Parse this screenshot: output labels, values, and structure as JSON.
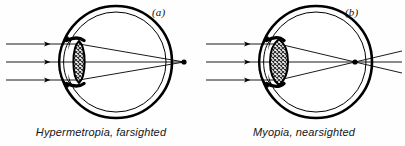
{
  "figure": {
    "background_color": "#fefefe",
    "ink_color": "#000000",
    "width": 405,
    "height": 146
  },
  "panels": [
    {
      "id": "a",
      "label": "(a)",
      "caption": "Hypermetropia, farsighted",
      "condition": "Hypermetropia",
      "common_name": "farsighted",
      "focus_location": "behind the retina, outside the eyeball",
      "lens_shape": "thin biconvex, cross-hatched",
      "incoming_rays": 3,
      "eye": {
        "center_x": 116,
        "center_y": 62,
        "outer_radius": 56,
        "inner_radius": 50
      },
      "lens": {
        "center_x": 79,
        "center_y": 62,
        "half_height": 21,
        "half_width": 7
      },
      "focal_point": {
        "x": 184,
        "y": 62
      },
      "ray_y": [
        44,
        62,
        80
      ]
    },
    {
      "id": "b",
      "label": "(b)",
      "caption": "Myopia, nearsighted",
      "condition": "Myopia",
      "common_name": "nearsighted",
      "focus_location": "in front of the retina, inside the eyeball",
      "lens_shape": "thick biconvex, cross-hatched",
      "incoming_rays": 3,
      "eye": {
        "center_x": 113,
        "center_y": 62,
        "outer_radius": 56,
        "inner_radius": 50
      },
      "lens": {
        "center_x": 76,
        "center_y": 62,
        "half_height": 23,
        "half_width": 11
      },
      "focal_point": {
        "x": 152,
        "y": 62
      },
      "ray_y": [
        44,
        62,
        80
      ]
    }
  ]
}
